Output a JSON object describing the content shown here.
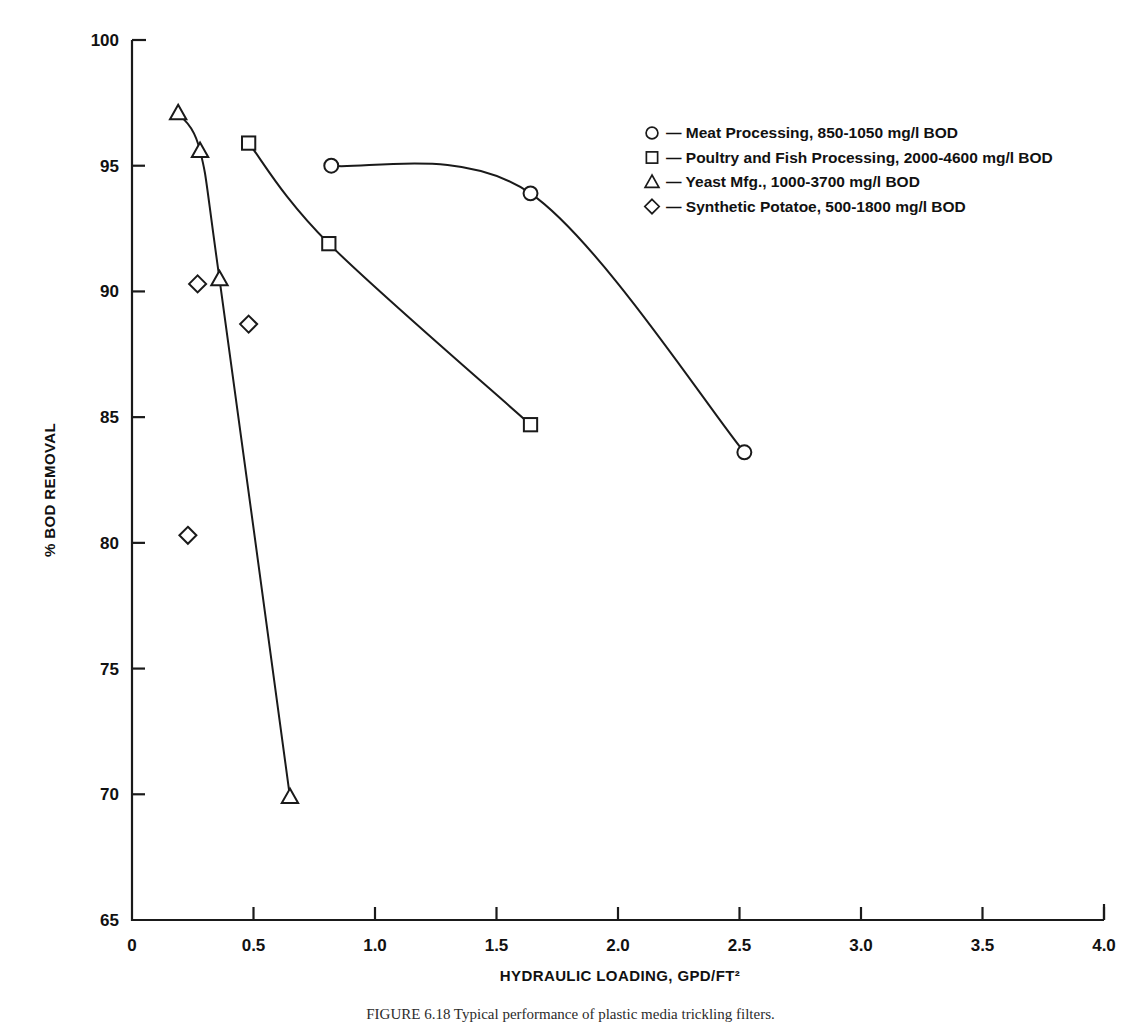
{
  "figure": {
    "caption": "FIGURE 6.18    Typical performance of plastic media trickling filters.",
    "xlabel": "HYDRAULIC LOADING, GPD/FT²",
    "ylabel": "% BOD REMOVAL"
  },
  "legend": {
    "items": [
      {
        "marker": "circle-marker",
        "label": "— Meat Processing, 850-1050 mg/l BOD"
      },
      {
        "marker": "square-marker",
        "label": "— Poultry and Fish Processing, 2000-4600 mg/l BOD"
      },
      {
        "marker": "triangle-marker",
        "label": "— Yeast Mfg., 1000-3700 mg/l BOD"
      },
      {
        "marker": "diamond-marker",
        "label": "— Synthetic Potatoe, 500-1800 mg/l BOD"
      }
    ]
  },
  "axes": {
    "x_ticks": [
      "0",
      "0.5",
      "1.0",
      "1.5",
      "2.0",
      "2.5",
      "3.0",
      "3.5",
      "4.0"
    ],
    "y_ticks": [
      "65",
      "70",
      "75",
      "80",
      "85",
      "90",
      "95",
      "100"
    ]
  },
  "chart_data": {
    "type": "scatter",
    "title": "",
    "xlabel": "HYDRAULIC LOADING, GPD/FT²",
    "ylabel": "% BOD REMOVAL",
    "xlim": [
      0,
      4.0
    ],
    "ylim": [
      65,
      100
    ],
    "xticks": [
      0,
      0.5,
      1.0,
      1.5,
      2.0,
      2.5,
      3.0,
      3.5,
      4.0
    ],
    "yticks": [
      65,
      70,
      75,
      80,
      85,
      90,
      95,
      100
    ],
    "grid": false,
    "legend_position": "upper-right",
    "series": [
      {
        "name": "Meat Processing, 850-1050 mg/l BOD",
        "marker": "circle",
        "connected": true,
        "points": [
          {
            "x": 0.82,
            "y": 95.0
          },
          {
            "x": 1.64,
            "y": 93.9
          },
          {
            "x": 2.52,
            "y": 83.6
          }
        ]
      },
      {
        "name": "Poultry and Fish Processing, 2000-4600 mg/l BOD",
        "marker": "square",
        "connected": true,
        "points": [
          {
            "x": 0.48,
            "y": 95.9
          },
          {
            "x": 0.81,
            "y": 91.9
          },
          {
            "x": 1.64,
            "y": 84.7
          }
        ]
      },
      {
        "name": "Yeast Mfg., 1000-3700 mg/l BOD",
        "marker": "triangle",
        "connected": true,
        "points": [
          {
            "x": 0.19,
            "y": 97.1
          },
          {
            "x": 0.28,
            "y": 95.6
          },
          {
            "x": 0.36,
            "y": 90.5
          },
          {
            "x": 0.65,
            "y": 69.9
          }
        ]
      },
      {
        "name": "Synthetic Potatoe, 500-1800 mg/l BOD",
        "marker": "diamond",
        "connected": false,
        "points": [
          {
            "x": 0.27,
            "y": 90.3
          },
          {
            "x": 0.48,
            "y": 88.7
          },
          {
            "x": 0.23,
            "y": 80.3
          }
        ]
      }
    ]
  }
}
